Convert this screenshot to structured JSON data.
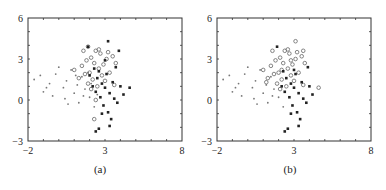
{
  "chart_data": [
    {
      "type": "scatter",
      "caption": "(a)",
      "xlim": [
        -2,
        8
      ],
      "ylim": [
        -3,
        6
      ],
      "xticks": [
        "-2",
        "3",
        "8"
      ],
      "yticks": [
        "6",
        "3",
        "0",
        "-3"
      ],
      "grid": false,
      "series": [
        {
          "name": "dots",
          "marker": "dot",
          "points": [
            [
              -1.6,
              1.5
            ],
            [
              -1.2,
              1.8
            ],
            [
              -1.0,
              0.6
            ],
            [
              -0.6,
              1.2
            ],
            [
              -0.4,
              0.3
            ],
            [
              -0.2,
              1.9
            ],
            [
              0.0,
              2.4
            ],
            [
              0.3,
              0.9
            ],
            [
              0.5,
              1.4
            ],
            [
              0.6,
              -0.3
            ],
            [
              0.8,
              2.2
            ],
            [
              1.0,
              0.5
            ],
            [
              1.2,
              1.1
            ],
            [
              1.3,
              -0.2
            ],
            [
              1.5,
              1.7
            ],
            [
              1.7,
              0.8
            ],
            [
              1.9,
              2.0
            ],
            [
              2.0,
              0.2
            ],
            [
              2.1,
              1.2
            ],
            [
              2.3,
              -0.5
            ],
            [
              2.5,
              0.4
            ],
            [
              1.1,
              1.8
            ],
            [
              0.4,
              0.1
            ],
            [
              1.6,
              0.3
            ],
            [
              -0.8,
              0.9
            ]
          ]
        },
        {
          "name": "circles",
          "marker": "circle",
          "points": [
            [
              1.0,
              2.2
            ],
            [
              1.3,
              1.6
            ],
            [
              1.5,
              2.5
            ],
            [
              1.6,
              3.6
            ],
            [
              1.8,
              2.9
            ],
            [
              1.9,
              1.2
            ],
            [
              2.0,
              2.0
            ],
            [
              2.1,
              3.1
            ],
            [
              2.2,
              1.5
            ],
            [
              2.3,
              2.7
            ],
            [
              2.4,
              3.6
            ],
            [
              2.5,
              1.0
            ],
            [
              2.6,
              2.3
            ],
            [
              2.7,
              3.4
            ],
            [
              2.8,
              1.8
            ],
            [
              2.9,
              2.6
            ],
            [
              3.0,
              1.4
            ],
            [
              3.1,
              3.0
            ],
            [
              3.3,
              2.0
            ],
            [
              3.5,
              3.2
            ],
            [
              3.6,
              1.1
            ],
            [
              3.7,
              2.7
            ],
            [
              2.1,
              0.8
            ],
            [
              1.7,
              1.9
            ],
            [
              2.4,
              0.0
            ],
            [
              2.3,
              -1.4
            ],
            [
              1.9,
              3.9
            ],
            [
              2.6,
              3.7
            ],
            [
              3.2,
              3.5
            ]
          ]
        },
        {
          "name": "squares",
          "marker": "square",
          "points": [
            [
              1.9,
              3.9
            ],
            [
              2.0,
              1.8
            ],
            [
              2.2,
              1.0
            ],
            [
              2.3,
              2.3
            ],
            [
              2.4,
              0.6
            ],
            [
              2.5,
              1.6
            ],
            [
              2.6,
              2.1
            ],
            [
              2.7,
              0.2
            ],
            [
              2.8,
              1.2
            ],
            [
              2.9,
              -0.4
            ],
            [
              3.0,
              2.9
            ],
            [
              3.0,
              0.9
            ],
            [
              3.1,
              1.9
            ],
            [
              3.2,
              -0.9
            ],
            [
              3.3,
              0.5
            ],
            [
              3.4,
              -1.4
            ],
            [
              3.5,
              1.3
            ],
            [
              3.6,
              0.1
            ],
            [
              3.7,
              2.4
            ],
            [
              3.8,
              -0.2
            ],
            [
              4.0,
              1.0
            ],
            [
              4.2,
              0.4
            ],
            [
              4.6,
              0.9
            ],
            [
              2.6,
              -2.1
            ],
            [
              2.4,
              -2.3
            ],
            [
              3.2,
              4.3
            ],
            [
              3.9,
              3.6
            ],
            [
              3.3,
              -1.9
            ],
            [
              2.8,
              -1.0
            ]
          ]
        }
      ]
    },
    {
      "type": "scatter",
      "caption": "(b)",
      "xlim": [
        -2,
        8
      ],
      "ylim": [
        -3,
        6
      ],
      "xticks": [
        "-2",
        "3",
        "8"
      ],
      "yticks": [
        "6",
        "3",
        "0",
        "-3"
      ],
      "grid": false,
      "series": [
        {
          "name": "dots",
          "marker": "dot",
          "points": [
            [
              -1.6,
              1.5
            ],
            [
              -1.2,
              1.8
            ],
            [
              -1.0,
              0.6
            ],
            [
              -0.6,
              1.2
            ],
            [
              -0.4,
              0.3
            ],
            [
              -0.2,
              1.9
            ],
            [
              0.0,
              2.4
            ],
            [
              0.3,
              0.9
            ],
            [
              0.5,
              1.4
            ],
            [
              0.6,
              -0.3
            ],
            [
              0.8,
              2.2
            ],
            [
              1.0,
              0.5
            ],
            [
              1.2,
              1.1
            ],
            [
              1.3,
              -0.2
            ],
            [
              1.5,
              1.7
            ],
            [
              1.7,
              0.8
            ],
            [
              2.0,
              0.2
            ],
            [
              2.3,
              -0.5
            ],
            [
              0.4,
              0.1
            ],
            [
              1.6,
              0.3
            ],
            [
              -0.8,
              0.9
            ]
          ]
        },
        {
          "name": "circles",
          "marker": "circle",
          "points": [
            [
              1.0,
              2.2
            ],
            [
              1.3,
              1.6
            ],
            [
              1.5,
              2.5
            ],
            [
              1.6,
              3.6
            ],
            [
              1.8,
              2.9
            ],
            [
              1.9,
              1.2
            ],
            [
              2.0,
              2.0
            ],
            [
              2.1,
              3.1
            ],
            [
              2.2,
              1.5
            ],
            [
              2.3,
              2.7
            ],
            [
              2.4,
              3.6
            ],
            [
              2.5,
              1.0
            ],
            [
              2.6,
              2.3
            ],
            [
              2.7,
              3.4
            ],
            [
              2.8,
              1.8
            ],
            [
              2.9,
              2.6
            ],
            [
              3.0,
              1.4
            ],
            [
              3.1,
              3.0
            ],
            [
              3.3,
              2.0
            ],
            [
              3.5,
              3.2
            ],
            [
              3.6,
              1.1
            ],
            [
              3.7,
              2.7
            ],
            [
              2.1,
              0.8
            ],
            [
              1.7,
              1.9
            ],
            [
              3.1,
              4.3
            ],
            [
              3.6,
              3.6
            ],
            [
              2.6,
              3.7
            ],
            [
              3.2,
              3.5
            ],
            [
              2.2,
              2.2
            ],
            [
              2.8,
              2.9
            ],
            [
              1.2,
              1.3
            ],
            [
              4.6,
              0.9
            ]
          ]
        },
        {
          "name": "squares",
          "marker": "square",
          "points": [
            [
              1.9,
              3.9
            ],
            [
              2.2,
              1.0
            ],
            [
              2.4,
              0.6
            ],
            [
              2.5,
              1.6
            ],
            [
              2.7,
              0.2
            ],
            [
              2.8,
              1.2
            ],
            [
              2.9,
              -0.4
            ],
            [
              3.0,
              0.9
            ],
            [
              3.1,
              1.9
            ],
            [
              3.2,
              -0.9
            ],
            [
              3.3,
              0.5
            ],
            [
              3.4,
              -1.4
            ],
            [
              3.5,
              1.3
            ],
            [
              3.6,
              0.1
            ],
            [
              3.8,
              -0.2
            ],
            [
              4.0,
              1.0
            ],
            [
              4.2,
              0.4
            ],
            [
              2.6,
              -2.1
            ],
            [
              2.4,
              -2.3
            ],
            [
              3.3,
              -1.9
            ],
            [
              2.8,
              -1.0
            ],
            [
              3.0,
              2.2
            ],
            [
              2.3,
              2.1
            ],
            [
              3.9,
              2.4
            ]
          ]
        }
      ]
    }
  ]
}
